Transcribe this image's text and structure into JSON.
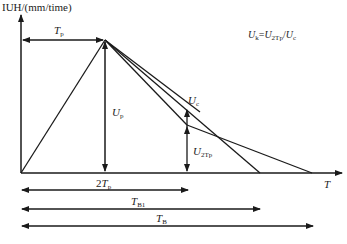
{
  "diagram": {
    "y_axis_label": "IUH/(mm/time)",
    "x_axis_label": "T",
    "formula": {
      "U": "U",
      "k": "k",
      "eq": "=",
      "U2": "U",
      "sub2": "2Tp",
      "slash": "/",
      "U3": "U",
      "subc": "c"
    },
    "labels": {
      "Tp": {
        "main": "T",
        "sub": "p"
      },
      "Up": {
        "main": "U",
        "sub": "p"
      },
      "Uc": {
        "main": "U",
        "sub": "c"
      },
      "U2Tp": {
        "main": "U",
        "sub": "2Tp"
      },
      "twoTp": {
        "pre": "2",
        "main": "T",
        "sub": "p"
      },
      "TB1": {
        "main": "T",
        "sub": "B1"
      },
      "TB": {
        "main": "T",
        "sub": "B"
      }
    },
    "line_color": "#1a1a1a"
  }
}
